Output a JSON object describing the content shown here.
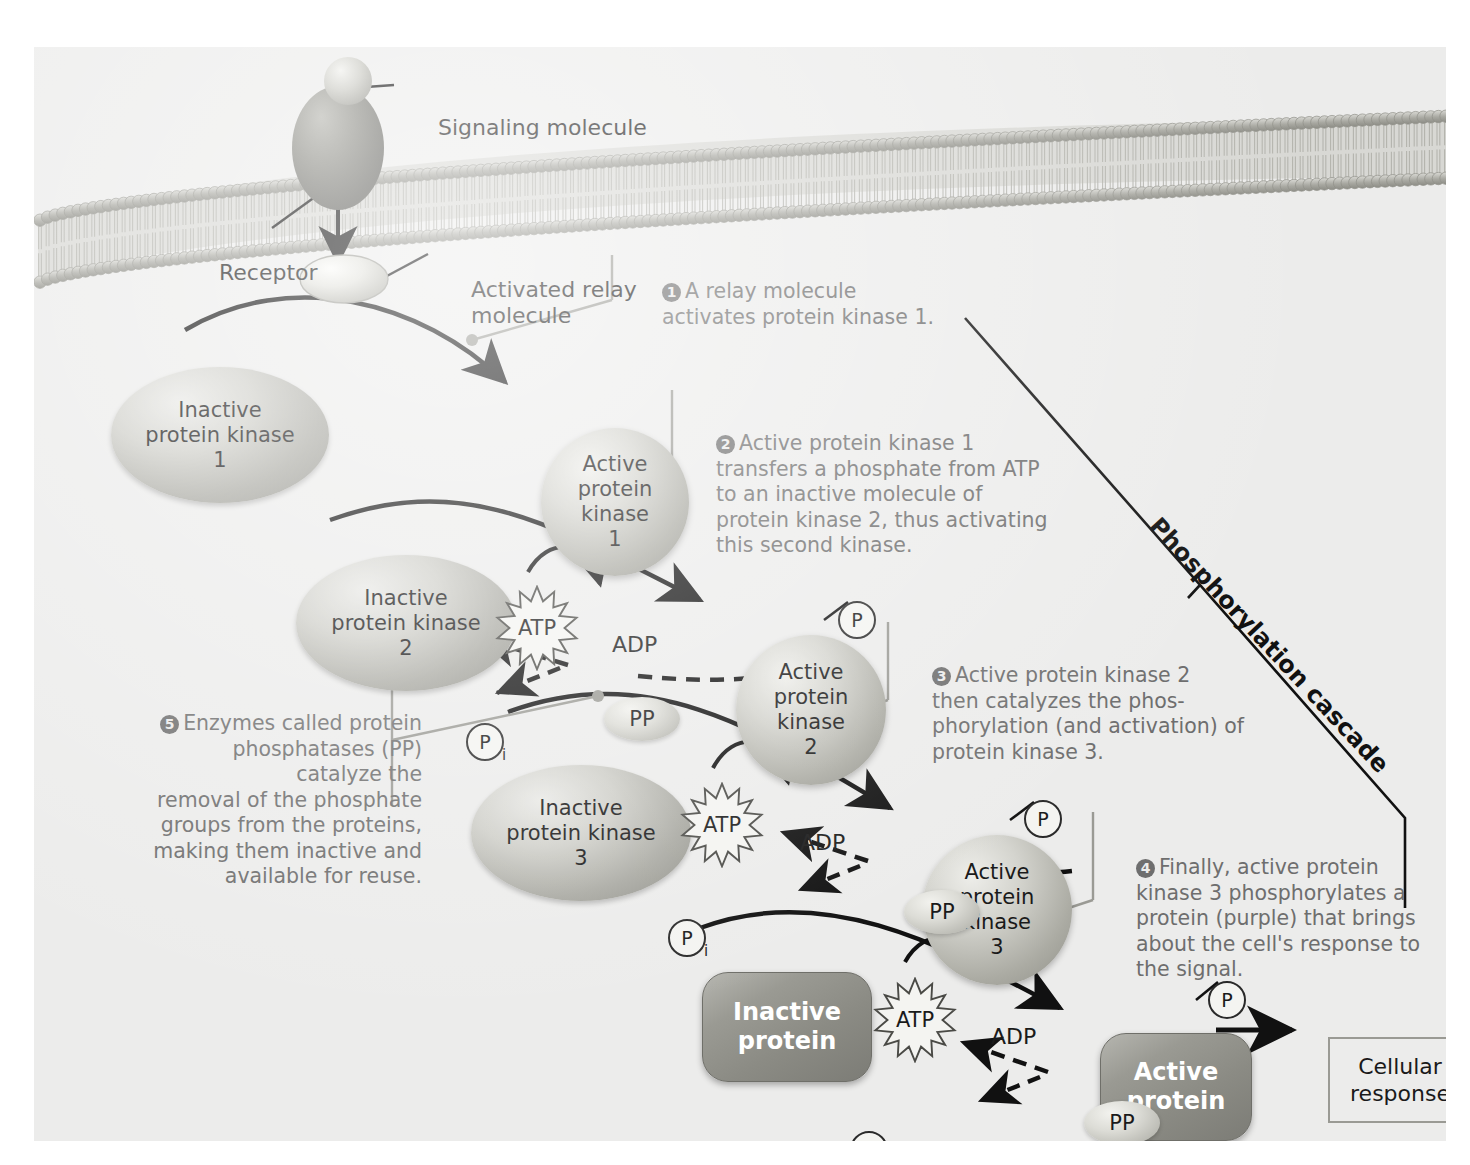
{
  "figure": {
    "background_color": "#ececeb",
    "text_color": "#1a1a1a",
    "note_color": "#6e6e6e"
  },
  "labels": {
    "signaling_molecule": "Signaling molecule",
    "receptor": "Receptor",
    "activated_relay": "Activated relay",
    "activated_relay_2": "molecule",
    "cascade": "Phosphorylation cascade"
  },
  "molecules": {
    "inactive_kinase_1": {
      "line1": "Inactive",
      "line2": "protein kinase",
      "line3": "1"
    },
    "active_kinase_1": {
      "line1": "Active",
      "line2": "protein",
      "line3": "kinase",
      "line4": "1"
    },
    "inactive_kinase_2": {
      "line1": "Inactive",
      "line2": "protein kinase",
      "line3": "2"
    },
    "active_kinase_2": {
      "line1": "Active",
      "line2": "protein",
      "line3": "kinase",
      "line4": "2"
    },
    "inactive_kinase_3": {
      "line1": "Inactive",
      "line2": "protein kinase",
      "line3": "3"
    },
    "active_kinase_3": {
      "line1": "Active",
      "line2": "protein",
      "line3": "kinase",
      "line4": "3"
    },
    "inactive_protein": {
      "line1": "Inactive",
      "line2": "protein"
    },
    "active_protein": {
      "line1": "Active",
      "line2": "protein"
    },
    "cellular_response": {
      "line1": "Cellular",
      "line2": "response"
    }
  },
  "energy": {
    "atp": "ATP",
    "adp": "ADP",
    "phosphate": "P",
    "phosphate_sub": "i",
    "phosphatase": "PP"
  },
  "steps": [
    {
      "number": "1",
      "lines": [
        "A relay molecule",
        "activates protein kinase 1."
      ]
    },
    {
      "number": "2",
      "lines": [
        "Active protein kinase 1",
        "transfers a phosphate from ATP",
        "to an inactive molecule of",
        "protein kinase 2, thus activating",
        "this second kinase."
      ]
    },
    {
      "number": "3",
      "lines": [
        "Active protein kinase 2",
        "then catalyzes the phos-",
        "phorylation (and activation) of",
        "protein kinase 3."
      ]
    },
    {
      "number": "4",
      "lines": [
        "Finally, active protein",
        "kinase 3 phosphorylates a",
        "protein (purple) that brings",
        "about the cell's response to",
        "the signal."
      ]
    },
    {
      "number": "5",
      "lines": [
        "Enzymes called protein",
        "phosphatases (PP) catalyze the",
        "removal of the phosphate",
        "groups from the proteins,",
        "making them inactive and",
        "available for reuse."
      ]
    }
  ]
}
